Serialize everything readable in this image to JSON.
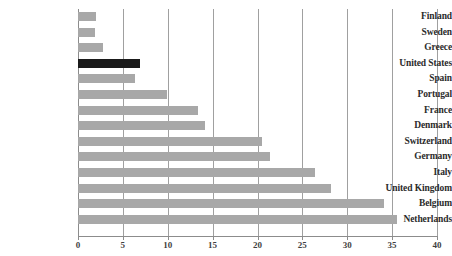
{
  "chart_data": {
    "type": "bar",
    "orientation": "horizontal",
    "title": "",
    "subtitle": "",
    "xlabel": "",
    "ylabel": "",
    "xlim": [
      0,
      40
    ],
    "ylim": null,
    "grid": true,
    "grid_axis": "x",
    "legend": false,
    "legend_position": "none",
    "xticks": [
      0,
      5,
      10,
      15,
      20,
      25,
      30,
      35,
      40
    ],
    "xtick_labels": [
      "0",
      "5",
      "10",
      "15",
      "20",
      "25",
      "30",
      "35",
      "40"
    ],
    "categories": [
      "Finland",
      "Sweden",
      "Greece",
      "United States",
      "Spain",
      "Portugal",
      "France",
      "Denmark",
      "Switzerland",
      "Germany",
      "Italy",
      "United Kingdom",
      "Belgium",
      "Netherlands"
    ],
    "values": [
      2.0,
      1.9,
      2.8,
      6.9,
      6.3,
      9.9,
      13.4,
      14.1,
      20.5,
      21.4,
      26.4,
      28.2,
      34.1,
      35.5
    ],
    "highlight_category": "United States",
    "colors": {
      "bar": "#a8a8a8",
      "bar_highlight": "#1a1a1a",
      "gridline": "#a0a0a0",
      "axis": "#8c8c8c",
      "label_text": "#2b2b2b",
      "tick_text": "#3f3f3f",
      "background": "#ffffff"
    }
  }
}
